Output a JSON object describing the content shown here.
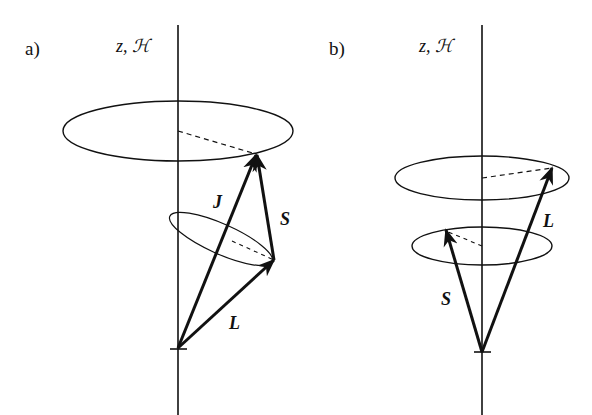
{
  "panels": [
    {
      "id": "a",
      "label": "a)",
      "axis_label": "z, ℋ",
      "vectors": [
        {
          "name": "J",
          "label": "J",
          "from": [
            178,
            348
          ],
          "to": [
            256,
            155
          ]
        },
        {
          "name": "S",
          "label": "S",
          "from": [
            274,
            260
          ],
          "to": [
            256,
            155
          ]
        },
        {
          "name": "L",
          "label": "L",
          "from": [
            178,
            348
          ],
          "to": [
            274,
            260
          ]
        }
      ],
      "description": "Vector model: L and S precess about J, J precesses about z/H"
    },
    {
      "id": "b",
      "label": "b)",
      "axis_label": "z, ℋ",
      "vectors": [
        {
          "name": "L",
          "label": "L",
          "from": [
            482,
            352
          ],
          "to": [
            552,
            168
          ]
        },
        {
          "name": "S",
          "label": "S",
          "from": [
            482,
            352
          ],
          "to": [
            446,
            230
          ]
        }
      ],
      "description": "Decoupled: L and S precess independently about z/H"
    }
  ],
  "colors": {
    "stroke": "#111111",
    "background": "#ffffff"
  }
}
